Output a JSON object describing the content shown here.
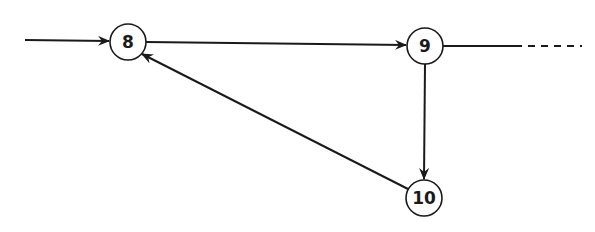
{
  "diagram": {
    "type": "flow-graph",
    "colors": {
      "stroke": "#1a1a1a",
      "background": "#ffffff"
    },
    "nodes": [
      {
        "id": "8",
        "label": "8",
        "cx": 128,
        "cy": 42,
        "r": 18
      },
      {
        "id": "9",
        "label": "9",
        "cx": 425,
        "cy": 46,
        "r": 18
      },
      {
        "id": "10",
        "label": "10",
        "cx": 424,
        "cy": 198,
        "r": 18
      }
    ],
    "edges": [
      {
        "from": "entry",
        "to": "8",
        "style": "solid",
        "directed": true
      },
      {
        "from": "8",
        "to": "9",
        "style": "solid",
        "directed": true
      },
      {
        "from": "9",
        "to": "10",
        "style": "solid",
        "directed": true
      },
      {
        "from": "10",
        "to": "8",
        "style": "solid",
        "directed": true
      },
      {
        "from": "9",
        "to": "continuation",
        "style": "solid-then-dashed",
        "directed": false
      }
    ]
  }
}
